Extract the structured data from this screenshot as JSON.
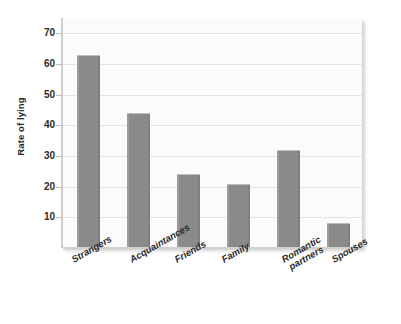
{
  "chart_data": {
    "type": "bar",
    "title": "",
    "subtitle": "",
    "xlabel": "",
    "ylabel": "Rate of lying",
    "categories": [
      "Strangers",
      "Acquaintances",
      "Friends",
      "Family",
      "Romantic partners",
      "Spouses"
    ],
    "values": [
      63,
      44,
      24,
      21,
      32,
      8
    ],
    "ylim": [
      0,
      75
    ],
    "yticks": [
      10,
      20,
      30,
      40,
      50,
      60,
      70
    ],
    "ytick_labels": [
      "10",
      "20",
      "30",
      "40",
      "50",
      "60",
      "70"
    ],
    "grid": true,
    "grid_axis": "y",
    "legend": false,
    "legend_position": "none",
    "bar_color": "#8a8a8a",
    "plot_background": "#fbfbfb",
    "gridline_color": "#e3e3e3",
    "axis_color": "#cfcfcf",
    "text_color": "#2b2b2b",
    "bars": [
      {
        "category": "Strangers",
        "value": 63,
        "label_line1": "Strangers",
        "label_line2": ""
      },
      {
        "category": "Acquaintances",
        "value": 44,
        "label_line1": "Acquaintances",
        "label_line2": ""
      },
      {
        "category": "Friends",
        "value": 24,
        "label_line1": "Friends",
        "label_line2": ""
      },
      {
        "category": "Family",
        "value": 21,
        "label_line1": "Family",
        "label_line2": ""
      },
      {
        "category": "Romantic partners",
        "value": 32,
        "label_line1": "Romantic",
        "label_line2": "partners"
      },
      {
        "category": "Spouses",
        "value": 8,
        "label_line1": "Spouses",
        "label_line2": ""
      }
    ]
  }
}
